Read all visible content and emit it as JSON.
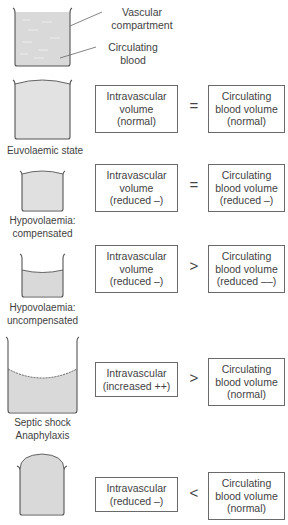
{
  "legend": {
    "vascular_compartment": "Vascular compartment",
    "vascular_line1": "Vascular",
    "vascular_line2": "compartment",
    "circulating_line1": "Circulating",
    "circulating_line2": "blood"
  },
  "colors": {
    "fluid": "#d9d9d9",
    "vessel_outline": "#555555",
    "box_border": "#6a6a6a",
    "text": "#3f3f3f"
  },
  "rows": [
    {
      "state_label": [
        "Euvolaemic state"
      ],
      "intravascular": [
        "Intravascular",
        "volume",
        "(normal)"
      ],
      "operator": "=",
      "circulating": [
        "Circulating",
        "blood volume",
        "(normal)"
      ]
    },
    {
      "state_label": [
        "Hypovolaemia:",
        "compensated"
      ],
      "intravascular": [
        "Intravascular",
        "volume",
        "(reduced –)"
      ],
      "operator": "=",
      "circulating": [
        "Circulating",
        "blood volume",
        "(reduced –)"
      ]
    },
    {
      "state_label": [
        "Hypovolaemia:",
        "uncompensated"
      ],
      "intravascular": [
        "Intravascular",
        "volume",
        "(reduced –)"
      ],
      "operator": ">",
      "circulating": [
        "Circulating",
        "blood volume",
        "(reduced ––)"
      ]
    },
    {
      "state_label": [
        "Septic shock",
        "Anaphylaxis"
      ],
      "intravascular": [
        "Intravascular",
        "(increased ++)"
      ],
      "operator": ">",
      "circulating": [
        "Circulating",
        "blood volume",
        "(normal)"
      ]
    },
    {
      "state_label": [],
      "intravascular": [
        "Intravascular",
        "(reduced –)"
      ],
      "operator": "<",
      "circulating": [
        "Circulating",
        "blood volume",
        "(normal)"
      ]
    }
  ]
}
